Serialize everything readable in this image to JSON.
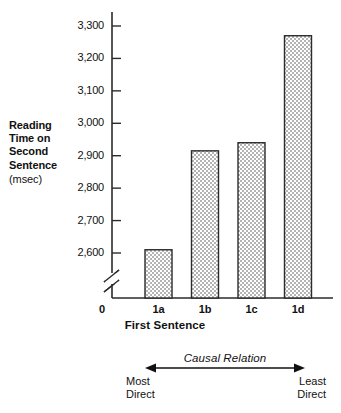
{
  "figure": {
    "y_axis_label_lines": [
      "Reading",
      "Time on",
      "Second",
      "Sentence"
    ],
    "y_axis_unit": "(msec)",
    "x_axis_title": "First Sentence",
    "origin_label": "0",
    "annotation": {
      "caption": "Causal Relation",
      "left_label_lines": [
        "Most",
        "Direct"
      ],
      "right_label_lines": [
        "Least",
        "Direct"
      ],
      "arrow_style": "double-headed"
    }
  },
  "chart_data": {
    "type": "bar",
    "title": "",
    "xlabel": "First Sentence",
    "ylabel": "Reading Time on Second Sentence (msec)",
    "categories": [
      "1a",
      "1b",
      "1c",
      "1d"
    ],
    "values": [
      2610,
      2915,
      2940,
      3270
    ],
    "ylim": [
      2600,
      3300
    ],
    "y_axis_break": true,
    "y_axis_break_note": "zigzag break between 0 and 2,600",
    "yticks": [
      2600,
      2700,
      2800,
      2900,
      3000,
      3100,
      3200,
      3300
    ],
    "ytick_labels": [
      "2,600",
      "2,700",
      "2,800",
      "2,900",
      "3,000",
      "3,100",
      "3,200",
      "3,300"
    ],
    "grid": false,
    "legend": false,
    "bar_fill": "#c9c9c9",
    "bar_fill_pattern": "fine-checkerboard-stipple",
    "bar_edge_color": "#2b2b2b",
    "axis_color": "#2b2b2b",
    "annotations": [
      {
        "text": "Causal Relation",
        "style": "italic",
        "position": "below-x-axis"
      },
      {
        "text": "Most Direct",
        "position": "below-left"
      },
      {
        "text": "Least Direct",
        "position": "below-right"
      }
    ]
  }
}
